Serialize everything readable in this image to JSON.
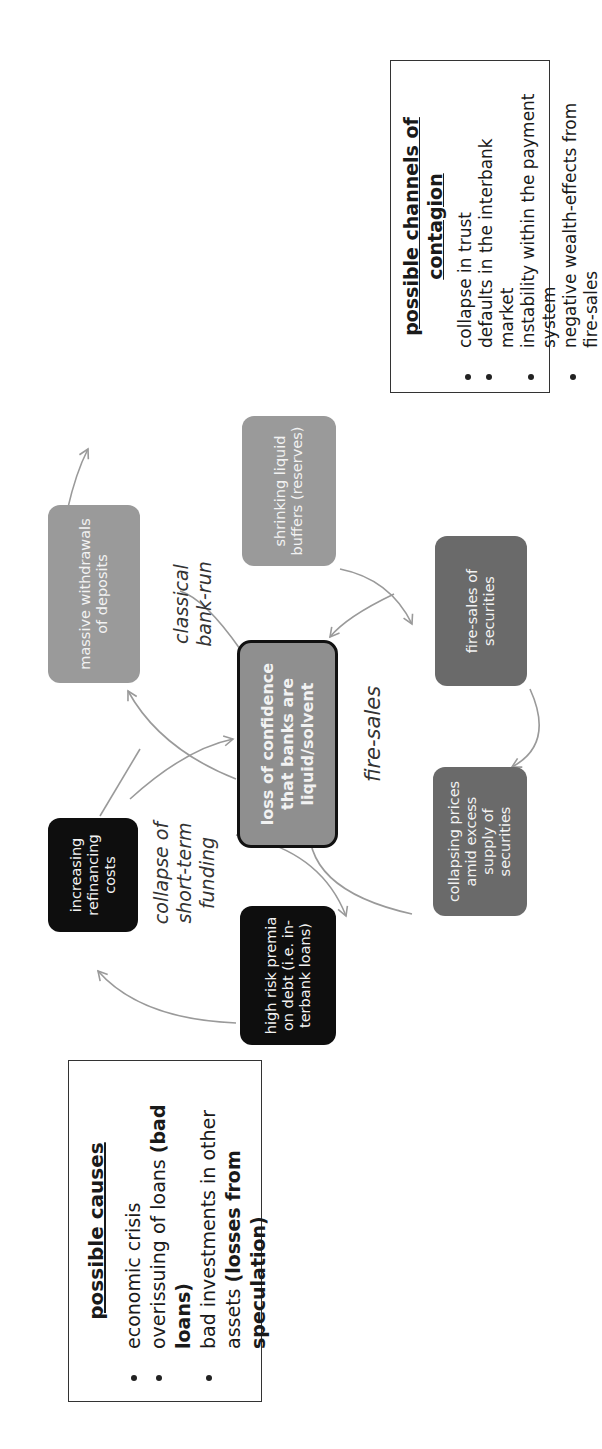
{
  "causes": {
    "title": "possible causes",
    "items": [
      {
        "text": "economic crisis",
        "bold": ""
      },
      {
        "text": "overissuing of loans ",
        "bold": "(bad loans)"
      },
      {
        "text": "bad investments in other assets ",
        "bold": "(losses from speculation)"
      }
    ]
  },
  "contagion": {
    "title": "possible channels of contagion",
    "items": [
      "collapse in trust",
      "defaults in the interbank market",
      "instability within the payment system",
      "negative wealth-effects from fire-sales"
    ]
  },
  "nodes": {
    "center": "loss of confidence that banks are liquid/solvent",
    "refinancing": "increasing refinancing costs",
    "risk_premia": "high risk premia on debt (i.e. in-terbank loans)",
    "withdrawals": "massive withdrawals of deposits",
    "buffers": "shrinking liquid buffers (reserves)",
    "fire_sales": "fire-sales of securities",
    "collapsing_prices": "collapsing prices amid excess supply of securities"
  },
  "loop_labels": {
    "funding": "collapse of short-term funding",
    "bank_run": "classical bank-run",
    "fire_sales": "fire-sales"
  },
  "colors": {
    "black_node": "#0e0e0e",
    "light_gray_node": "#9a9a9a",
    "dark_gray_node": "#6a6a6a",
    "center_node": "#8f8f8f",
    "arrow": "#9a9a9a"
  }
}
